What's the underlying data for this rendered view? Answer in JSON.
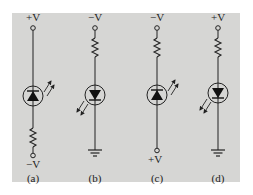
{
  "figure": {
    "background_color": "#d6d6d4",
    "circuits": [
      {
        "id": "a",
        "caption": "(a)",
        "top_label": "+V",
        "bottom_label": "−V",
        "top_terminal": "circle",
        "bottom_terminal": "circle",
        "resistor_position": "below_led",
        "led_orientation": "anode_bottom_cathode_top",
        "light_arrows": "outward_upper_right"
      },
      {
        "id": "b",
        "caption": "(b)",
        "top_label": "−V",
        "bottom_label": "",
        "top_terminal": "circle",
        "bottom_terminal": "ground",
        "resistor_position": "above_led",
        "led_orientation": "anode_top_cathode_bottom",
        "light_arrows": "inward_lower_left"
      },
      {
        "id": "c",
        "caption": "(c)",
        "top_label": "−V",
        "bottom_label": "+V",
        "top_terminal": "circle",
        "bottom_terminal": "circle",
        "resistor_position": "above_led",
        "led_orientation": "anode_bottom_cathode_top",
        "light_arrows": "outward_upper_right"
      },
      {
        "id": "d",
        "caption": "(d)",
        "top_label": "+V",
        "bottom_label": "",
        "top_terminal": "circle",
        "bottom_terminal": "ground",
        "resistor_position": "above_led",
        "led_orientation": "anode_top_cathode_bottom",
        "light_arrows": "inward_lower_left"
      }
    ]
  }
}
